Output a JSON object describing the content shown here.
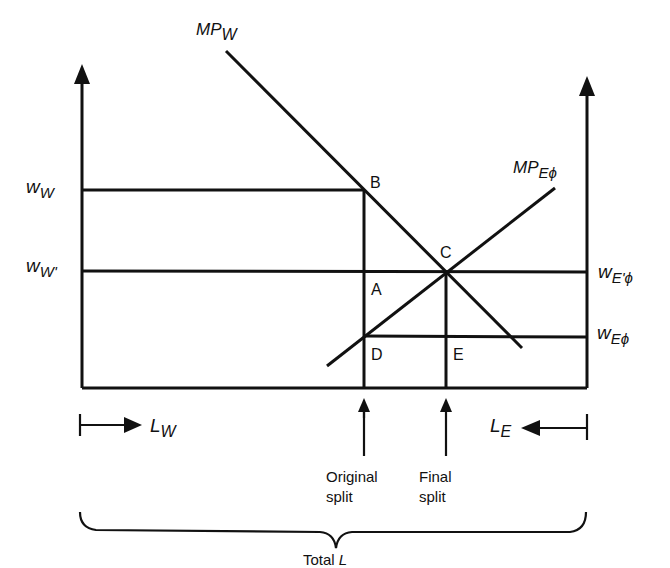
{
  "diagram": {
    "type": "labor-market two-sector wage diagram",
    "curves": {
      "mp_w": {
        "main": "MP",
        "sub": "W"
      },
      "mp_e": {
        "main": "MP",
        "sub": "Eϕ"
      }
    },
    "left_axis_labels": {
      "w_w": {
        "main": "w",
        "sub": "W"
      },
      "w_w_prime": {
        "main": "w",
        "sub": "W'"
      }
    },
    "right_axis_labels": {
      "w_e_prime": {
        "main": "w",
        "sub": "E'ϕ"
      },
      "w_e": {
        "main": "w",
        "sub": "Eϕ"
      }
    },
    "points": {
      "b": "B",
      "c": "C",
      "a": "A",
      "d": "D",
      "e": "E"
    },
    "bottom": {
      "l_w": {
        "main": "L",
        "sub": "W"
      },
      "l_e": {
        "main": "L",
        "sub": "E"
      },
      "original_split": {
        "line1": "Original",
        "line2": "split"
      },
      "final_split": {
        "line1": "Final",
        "line2": "split"
      },
      "total_l": {
        "prefix": "Total ",
        "var": "L"
      }
    },
    "colors": {
      "ink": "#111111",
      "background": "#ffffff"
    }
  }
}
